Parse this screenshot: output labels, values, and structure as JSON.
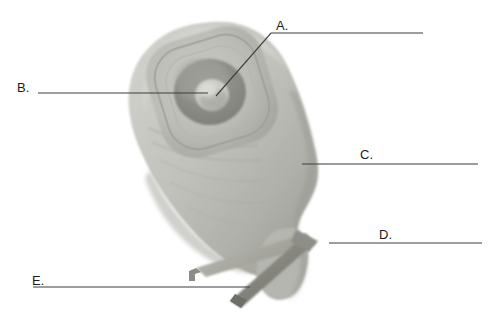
{
  "figure": {
    "background_color": "#ffffff",
    "leader_line_color": "#3d3d3d",
    "label_text_color": "#1b1b1b",
    "labels": [
      {
        "id": "A",
        "text": "A.",
        "target": "outer skin barrier ring / flange collar",
        "leader": {
          "type": "elbow",
          "points": "216,96 271,33 423,33"
        }
      },
      {
        "id": "B",
        "text": "B.",
        "target": "stoma opening at pouch aperture",
        "leader": {
          "type": "straight",
          "points": "38,93 208,93"
        }
      },
      {
        "id": "C",
        "text": "C.",
        "target": "pouch body / collection bag",
        "leader": {
          "type": "straight",
          "points": "302,164 478,164"
        }
      },
      {
        "id": "D",
        "text": "D.",
        "target": "lower pouch drainage tail",
        "leader": {
          "type": "straight",
          "points": "329,243 482,243"
        }
      },
      {
        "id": "E",
        "text": "E.",
        "target": "closure clamp / clip",
        "leader": {
          "type": "straight",
          "points": "33,287 250,287"
        }
      }
    ],
    "artwork": {
      "pouch_fill_light": "#c9c9c4",
      "pouch_fill_mid": "#b4b4ae",
      "pouch_fill_shadow": "#9d9d97",
      "flange_ring_outer": "#bdbdb7",
      "flange_ring_mid": "#a3a39d",
      "stoma_ring_dark": "#8a8a85",
      "stoma_center": "#cfcfca",
      "clamp_light": "#aeaea8",
      "clamp_dark": "#83837e"
    }
  }
}
